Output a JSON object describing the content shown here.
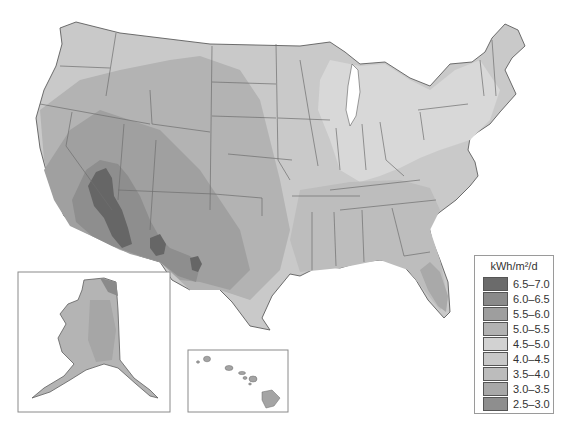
{
  "map": {
    "title": "Average daily solar radiation, United States",
    "unit": "kWh/m²/d",
    "regions": {
      "contiguous_us": "Contiguous United States",
      "alaska_inset": "Alaska",
      "hawaii_inset": "Hawaii"
    }
  },
  "legend": {
    "title": "kWh/m²/d",
    "items": [
      {
        "label": "6.5–7.0",
        "color": "#6b6b6b"
      },
      {
        "label": "6.0–6.5",
        "color": "#8a8a8a"
      },
      {
        "label": "5.5–6.0",
        "color": "#9e9e9e"
      },
      {
        "label": "5.0–5.5",
        "color": "#b2b2b2"
      },
      {
        "label": "4.5–5.0",
        "color": "#d2d2d2"
      },
      {
        "label": "4.0–4.5",
        "color": "#c8c8c8"
      },
      {
        "label": "3.5–4.0",
        "color": "#bcbcbc"
      },
      {
        "label": "3.0–3.5",
        "color": "#a8a8a8"
      },
      {
        "label": "2.5–3.0",
        "color": "#8e8e8e"
      }
    ]
  }
}
